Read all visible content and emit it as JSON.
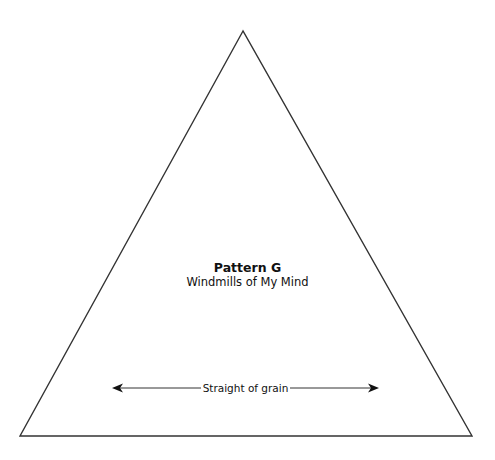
{
  "pattern": {
    "title": "Pattern G",
    "subtitle": "Windmills of My Mind"
  },
  "grain_arrow": {
    "label": "Straight of grain",
    "direction": "bidirectional"
  },
  "shape": {
    "type": "triangle",
    "stroke_color": "#333333",
    "fill_color": "#ffffff"
  }
}
